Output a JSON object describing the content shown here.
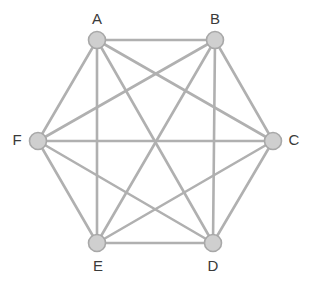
{
  "figure": {
    "name": "complete-graph-k6",
    "width": 315,
    "height": 284,
    "background_color": "#ffffff"
  },
  "style": {
    "edge_color": "#b0b0b0",
    "edge_width": 2.6,
    "node_fill": "#cfcfcf",
    "node_stroke": "#a8a8a8",
    "node_stroke_width": 1.6,
    "node_radius": 8.5,
    "label_color": "#3a3a3a",
    "label_font_size": 15
  },
  "graph_data": {
    "type": "graph",
    "vertex_count": 6,
    "edge_count": 15,
    "vertices": [
      {
        "id": "A",
        "label": "A",
        "x": 97,
        "y": 40,
        "label_x": 97,
        "label_y": 20
      },
      {
        "id": "B",
        "label": "B",
        "x": 215,
        "y": 40,
        "label_x": 215,
        "label_y": 20
      },
      {
        "id": "C",
        "label": "C",
        "x": 273,
        "y": 141,
        "label_x": 294,
        "label_y": 141
      },
      {
        "id": "D",
        "label": "D",
        "x": 213,
        "y": 243,
        "label_x": 213,
        "label_y": 267
      },
      {
        "id": "E",
        "label": "E",
        "x": 97,
        "y": 243,
        "label_x": 98,
        "label_y": 267
      },
      {
        "id": "F",
        "label": "F",
        "x": 38,
        "y": 141,
        "label_x": 17,
        "label_y": 141
      }
    ],
    "edges": [
      {
        "from": "A",
        "to": "B"
      },
      {
        "from": "A",
        "to": "C"
      },
      {
        "from": "A",
        "to": "D"
      },
      {
        "from": "A",
        "to": "E"
      },
      {
        "from": "A",
        "to": "F"
      },
      {
        "from": "B",
        "to": "C"
      },
      {
        "from": "B",
        "to": "D"
      },
      {
        "from": "B",
        "to": "E"
      },
      {
        "from": "B",
        "to": "F"
      },
      {
        "from": "C",
        "to": "D"
      },
      {
        "from": "C",
        "to": "E"
      },
      {
        "from": "C",
        "to": "F"
      },
      {
        "from": "D",
        "to": "E"
      },
      {
        "from": "D",
        "to": "F"
      },
      {
        "from": "E",
        "to": "F"
      }
    ]
  }
}
